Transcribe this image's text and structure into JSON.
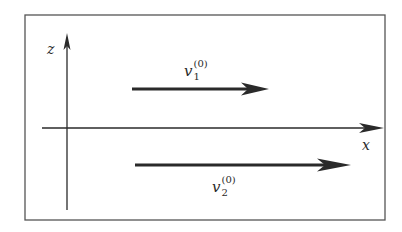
{
  "diagram": {
    "frame": {
      "x": 25,
      "y": 15,
      "width": 360,
      "height": 205,
      "stroke": "#555555"
    },
    "axes": {
      "z": {
        "label": "z",
        "x": 67,
        "y_start": 210,
        "y_end": 34
      },
      "x": {
        "label": "x",
        "y": 128,
        "x_start": 42,
        "x_end": 383
      }
    },
    "vectors": [
      {
        "id": "v1",
        "symbol": "v",
        "subscript": "1",
        "superscript": "(0)",
        "y": 89,
        "x_start": 132,
        "x_end": 268
      },
      {
        "id": "v2",
        "symbol": "v",
        "subscript": "2",
        "superscript": "(0)",
        "y": 165,
        "x_start": 135,
        "x_end": 350
      }
    ],
    "colors": {
      "ink": "#2a2a2a",
      "frame": "#555555",
      "background": "#ffffff"
    }
  }
}
